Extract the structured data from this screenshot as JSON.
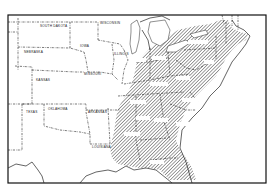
{
  "map": {
    "title": "",
    "hatch_color": "#2a2a2a",
    "background": "#ffffff",
    "unshaded_states": [
      {
        "label": "SOUTH DAKOTA",
        "x": 40,
        "y": 27
      },
      {
        "label": "NEBRASKA",
        "x": 35,
        "y": 53
      },
      {
        "label": "KANSAS",
        "x": 38,
        "y": 81
      },
      {
        "label": "IOWA",
        "x": 80,
        "y": 47
      },
      {
        "label": "WISCONSIN",
        "x": 108,
        "y": 24
      },
      {
        "label": "MISSOURI",
        "x": 90,
        "y": 74
      },
      {
        "label": "ILLINOIS",
        "x": 118,
        "y": 55
      },
      {
        "label": "OKLAHOMA",
        "x": 55,
        "y": 110
      },
      {
        "label": "TEXAS",
        "x": 27,
        "y": 113
      },
      {
        "label": "ARKANSAS",
        "x": 95,
        "y": 113
      },
      {
        "label": "LOUISIANA",
        "x": 99,
        "y": 147
      }
    ],
    "shaded_region": "Eastern United States (hatched)"
  }
}
